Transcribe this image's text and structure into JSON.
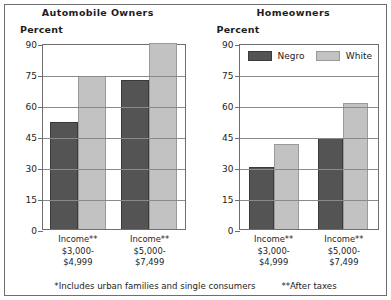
{
  "chart_data": {
    "type": "bar",
    "title": "",
    "panels": [
      {
        "title": "Automobile Owners",
        "ylabel": "Percent",
        "categories": [
          "Income**\n$3,000-\n$4,999",
          "Income**\n$5,000-\n$7,499"
        ],
        "category_lines": [
          [
            "Income**",
            "$3,000-",
            "$4,999"
          ],
          [
            "Income**",
            "$5,000-",
            "$7,499"
          ]
        ],
        "series": [
          {
            "name": "Negro",
            "values": [
              52,
              72
            ]
          },
          {
            "name": "White",
            "values": [
              74,
              90
            ]
          }
        ],
        "ylim": [
          0,
          90
        ],
        "yticks": [
          0,
          15,
          30,
          45,
          60,
          75,
          90
        ],
        "ytick_labels": [
          "0",
          "15",
          "30",
          "45",
          "60",
          "75",
          "90"
        ],
        "grid": true
      },
      {
        "title": "Homeowners",
        "ylabel": "Percent",
        "categories": [
          "Income**\n$3,000-\n$4,999",
          "Income**\n$5,000-\n$7,499"
        ],
        "category_lines": [
          [
            "Income**",
            "$3,000-",
            "$4,999"
          ],
          [
            "Income**",
            "$5,000-",
            "$7,499"
          ]
        ],
        "series": [
          {
            "name": "Negro",
            "values": [
              30,
              44
            ]
          },
          {
            "name": "White",
            "values": [
              41,
              61
            ]
          }
        ],
        "ylim": [
          0,
          90
        ],
        "yticks": [
          0,
          15,
          30,
          45,
          60,
          75,
          90
        ],
        "ytick_labels": [
          "0",
          "15",
          "30",
          "45",
          "60",
          "75",
          "90"
        ],
        "grid": true
      }
    ],
    "legend": {
      "position": "top-inside-right-panel",
      "entries": [
        {
          "label": "Negro",
          "color": "#545454"
        },
        {
          "label": "White",
          "color": "#c2c2c2"
        }
      ]
    },
    "annotations": [
      "*Includes urban families and single consumers",
      "**After taxes"
    ]
  },
  "left_panel": {
    "title": "Automobile Owners",
    "axis_title": "Percent",
    "ticks": [
      "90",
      "75",
      "60",
      "45",
      "30",
      "15",
      "0"
    ],
    "groups": [
      {
        "line1": "Income**",
        "line2": "$3,000-",
        "line3": "$4,999"
      },
      {
        "line1": "Income**",
        "line2": "$5,000-",
        "line3": "$7,499"
      }
    ]
  },
  "right_panel": {
    "title": "Homeowners",
    "axis_title": "Percent",
    "ticks": [
      "90",
      "75",
      "60",
      "45",
      "30",
      "15",
      "0"
    ],
    "groups": [
      {
        "line1": "Income**",
        "line2": "$3,000-",
        "line3": "$4,999"
      },
      {
        "line1": "Income**",
        "line2": "$5,000-",
        "line3": "$7,499"
      }
    ]
  },
  "legend": {
    "negro_label": "Negro",
    "white_label": "White"
  },
  "footnotes": {
    "note1": "*Includes urban families and single consumers",
    "note2": "**After taxes"
  }
}
